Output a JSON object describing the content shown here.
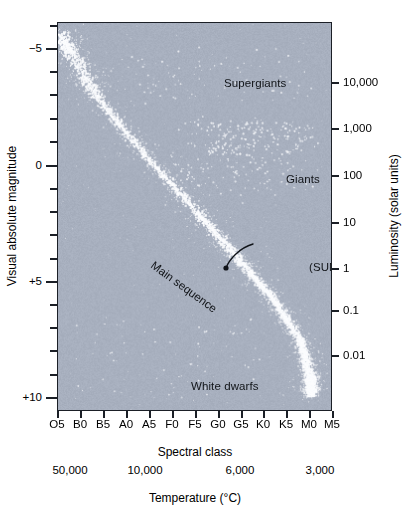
{
  "chart_data": {
    "type": "scatter",
    "xlabel": "Spectral class",
    "xlabel_secondary": "Temperature (°C)",
    "ylabel": "Visual absolute magnitude",
    "ylabel_secondary": "Luminosity (solar units)",
    "grid": false,
    "legend": "none",
    "x_axis": {
      "label": "Spectral class",
      "tick_labels": [
        "O5",
        "B0",
        "B5",
        "A0",
        "A5",
        "F0",
        "F5",
        "G0",
        "G5",
        "K0",
        "K5",
        "M0",
        "M5"
      ],
      "direction": "hot-to-cool"
    },
    "x_axis_secondary": {
      "label": "Temperature (°C)",
      "tick_labels": [
        "50,000",
        "10,000",
        "6,000",
        "3,000"
      ],
      "positions_px": [
        70,
        145,
        240,
        320
      ]
    },
    "y_axis_left": {
      "label": "Visual absolute magnitude",
      "tick_labels": [
        "−5",
        "0",
        "+5",
        "+10"
      ],
      "values": [
        -5,
        0,
        5,
        10
      ],
      "ylim": [
        -6.1,
        10.6
      ],
      "minor_tick_step": 1,
      "direction": "inverted"
    },
    "y_axis_right": {
      "label": "Luminosity (solar units)",
      "tick_labels": [
        "10,000",
        "1,000",
        "100",
        "10",
        "1",
        "0.1",
        "0.01"
      ],
      "values": [
        10000,
        1000,
        100,
        10,
        1,
        0.1,
        0.01
      ],
      "scale": "log"
    },
    "annotations": [
      {
        "name": "supergiants",
        "text": "Supergiants",
        "x_px": 210,
        "y_px": 62,
        "rotation": 0
      },
      {
        "name": "giants",
        "text": "Giants",
        "x_px": 250,
        "y_px": 157,
        "rotation": 0
      },
      {
        "name": "main-sequence",
        "text": "Main sequence",
        "x_px": 155,
        "y_px": 258,
        "rotation": 36
      },
      {
        "name": "sun",
        "text": "(SUN)",
        "x_px": 273,
        "y_px": 246,
        "rotation": 0,
        "pointer_target_px": [
          226,
          268
        ]
      },
      {
        "name": "white-dwarfs",
        "text": "White dwarfs",
        "x_px": 176,
        "y_px": 365,
        "rotation": 0
      }
    ],
    "series": [
      {
        "name": "Main sequence",
        "description": "Dense diagonal band of stars from hot luminous upper-left to cool dim lower-right",
        "point_count": 1700,
        "color": "#ffffff"
      },
      {
        "name": "Giants",
        "description": "Scattered cluster of stars at luminosity 100-1000, spectral class G-K",
        "point_count": 150,
        "color": "#e6ebf2"
      },
      {
        "name": "Supergiants",
        "description": "Sparse horizontal band near magnitude -5 across all spectral classes",
        "point_count": 70,
        "color": "#e6ebf2"
      },
      {
        "name": "White dwarfs",
        "description": "Sparse scatter near magnitude +10 to +13, spectral class B through K",
        "point_count": 45,
        "color": "#e6ebf2"
      }
    ],
    "colors": {
      "panel_background": "#a8b0bf",
      "axis": "#1b1f26",
      "star": "#ffffff",
      "text": "#000000",
      "page_background": "#ffffff"
    }
  },
  "axes": {
    "left": {
      "title": "Visual absolute magnitude",
      "ticks": [
        {
          "label": "−5",
          "y": 48
        },
        {
          "label": "0",
          "y": 165
        },
        {
          "label": "+5",
          "y": 281
        },
        {
          "label": "+10",
          "y": 397
        }
      ],
      "minor_y": [
        25,
        71,
        94,
        118,
        141,
        188,
        211,
        234,
        258,
        304,
        327,
        350,
        374
      ]
    },
    "right": {
      "title": "Luminosity (solar units)",
      "ticks": [
        {
          "label": "10,000",
          "y": 82
        },
        {
          "label": "1,000",
          "y": 128
        },
        {
          "label": "100",
          "y": 175
        },
        {
          "label": "10",
          "y": 222
        },
        {
          "label": "1",
          "y": 268
        },
        {
          "label": "0.1",
          "y": 310
        },
        {
          "label": "0.01",
          "y": 355
        }
      ]
    },
    "bottom_spectral": {
      "title": "Spectral class",
      "ticks": [
        {
          "label": "O5",
          "x": 57
        },
        {
          "label": "B0",
          "x": 80
        },
        {
          "label": "B5",
          "x": 103
        },
        {
          "label": "A0",
          "x": 126
        },
        {
          "label": "A5",
          "x": 149
        },
        {
          "label": "F0",
          "x": 172
        },
        {
          "label": "F5",
          "x": 195
        },
        {
          "label": "G0",
          "x": 218
        },
        {
          "label": "G5",
          "x": 241
        },
        {
          "label": "K0",
          "x": 263
        },
        {
          "label": "K5",
          "x": 286
        },
        {
          "label": "M0",
          "x": 309
        },
        {
          "label": "M5",
          "x": 332
        }
      ]
    },
    "bottom_temperature": {
      "title": "Temperature (°C)",
      "ticks": [
        {
          "label": "50,000",
          "x": 70
        },
        {
          "label": "10,000",
          "x": 145
        },
        {
          "label": "6,000",
          "x": 240
        },
        {
          "label": "3,000",
          "x": 320
        }
      ]
    }
  },
  "regions": {
    "supergiants": "Supergiants",
    "giants": "Giants",
    "main_sequence": "Main sequence",
    "white_dwarfs": "White dwarfs",
    "sun": "(SUN)"
  }
}
